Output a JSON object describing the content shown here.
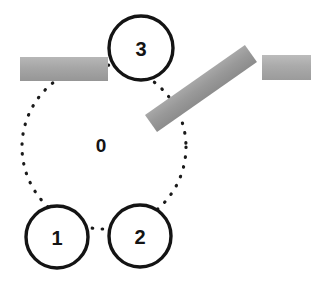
{
  "diagram": {
    "canvas": {
      "width": 314,
      "height": 289,
      "background": "#ffffff"
    },
    "orbit": {
      "name": "dotted-circular-path",
      "label": "0",
      "center_x": 104,
      "center_y": 147,
      "radius": 82,
      "stroke_color": "#1a1a1a",
      "stroke_width": 3.2,
      "dash": "0.5 9.5",
      "label_x": 101,
      "label_y": 145,
      "label_font_size": 19
    },
    "nodes": [
      {
        "label": "1",
        "name": "node-1",
        "cx": 57,
        "cy": 237,
        "r": 31,
        "stroke_color": "#141414",
        "stroke_width": 3.4,
        "fill": "#ffffff",
        "font_size": 20
      },
      {
        "label": "2",
        "name": "node-2",
        "cx": 140,
        "cy": 236,
        "r": 31,
        "stroke_color": "#141414",
        "stroke_width": 3.4,
        "fill": "#ffffff",
        "font_size": 20
      },
      {
        "label": "3",
        "name": "node-3",
        "cx": 141,
        "cy": 48,
        "r": 32,
        "stroke_color": "#141414",
        "stroke_width": 3.4,
        "fill": "#ffffff",
        "font_size": 20
      }
    ],
    "bars": [
      {
        "name": "obstacle-bar-left",
        "kind": "horizontal",
        "x": 20,
        "y": 57,
        "width": 88,
        "height": 24,
        "rotation_deg": 0,
        "color_top": "#b7b7b7",
        "color_mid": "#a6a6a6",
        "color_bottom": "#969696"
      },
      {
        "name": "obstacle-bar-diagonal",
        "kind": "diagonal",
        "x": 151,
        "y": 113,
        "width": 122,
        "height": 21,
        "rotation_deg": -35,
        "color_top": "#a8a8a8",
        "color_mid": "#999999",
        "color_bottom": "#8c8c8c"
      },
      {
        "name": "obstacle-bar-right",
        "kind": "horizontal",
        "x": 262,
        "y": 55,
        "width": 49,
        "height": 25,
        "rotation_deg": 0,
        "color_top": "#bcbcbc",
        "color_mid": "#aaaaaa",
        "color_bottom": "#9b9b9b"
      }
    ]
  }
}
